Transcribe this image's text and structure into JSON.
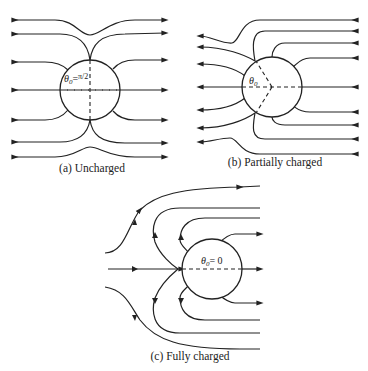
{
  "panels": [
    {
      "id": "a",
      "caption": "(a) Uncharged",
      "angle_label": "θ0 = π/2",
      "theta_symbol": "θ",
      "theta_sub": "0",
      "theta_value": "π/2"
    },
    {
      "id": "b",
      "caption": "(b) Partially charged",
      "angle_label": "θ0",
      "theta_symbol": "θ",
      "theta_sub": "0"
    },
    {
      "id": "c",
      "caption": "(c) Fully charged",
      "angle_label": "θ0 = 0",
      "theta_symbol": "θ",
      "theta_sub": "0",
      "theta_value": "= 0"
    }
  ],
  "colors": {
    "line": "#222222",
    "background": "#ffffff"
  }
}
